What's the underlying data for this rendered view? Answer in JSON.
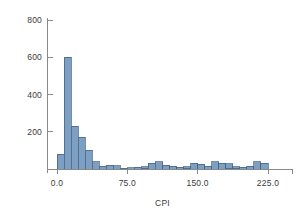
{
  "chart_data": {
    "type": "bar",
    "title": "",
    "subtitle": "",
    "xlabel": "CPI",
    "ylabel": "",
    "grid": false,
    "legend": null,
    "xlim": [
      -7.5,
      262.5
    ],
    "ylim": [
      0,
      860
    ],
    "xticks": [
      0.0,
      75.0,
      150.0,
      225.0
    ],
    "xtick_labels": [
      "0.0",
      "75.0",
      "150.0",
      "225.0"
    ],
    "yticks": [
      200,
      400,
      600,
      800
    ],
    "ytick_labels": [
      "200",
      "400",
      "600",
      "800"
    ],
    "bin_width": 7.5,
    "bin_starts": [
      0.0,
      7.5,
      15.0,
      22.5,
      30.0,
      37.5,
      45.0,
      52.5,
      60.0,
      67.5,
      75.0,
      82.5,
      90.0,
      97.5,
      105.0,
      112.5,
      120.0,
      127.5,
      135.0,
      142.5,
      150.0,
      157.5,
      165.0,
      172.5,
      180.0,
      187.5,
      195.0,
      202.5,
      210.0,
      217.5
    ],
    "categories": [
      "0.0",
      "7.5",
      "15.0",
      "22.5",
      "30.0",
      "37.5",
      "45.0",
      "52.5",
      "60.0",
      "67.5",
      "75.0",
      "82.5",
      "90.0",
      "97.5",
      "105.0",
      "112.5",
      "120.0",
      "127.5",
      "135.0",
      "142.5",
      "150.0",
      "157.5",
      "165.0",
      "172.5",
      "180.0",
      "187.5",
      "195.0",
      "202.5",
      "210.0",
      "217.5"
    ],
    "values": [
      80,
      600,
      230,
      170,
      100,
      40,
      15,
      20,
      18,
      5,
      8,
      10,
      12,
      30,
      40,
      20,
      14,
      10,
      12,
      30,
      26,
      14,
      40,
      30,
      28,
      12,
      10,
      14,
      40,
      30
    ],
    "bar_fill_color": "#7d9fc2",
    "bar_edge_color": "#3f5e80",
    "axis_color": "#8a8a8a",
    "text_color": "#3b3b3b",
    "background_color": "#ffffff"
  },
  "figure": {
    "axis_x_label": "CPI"
  }
}
